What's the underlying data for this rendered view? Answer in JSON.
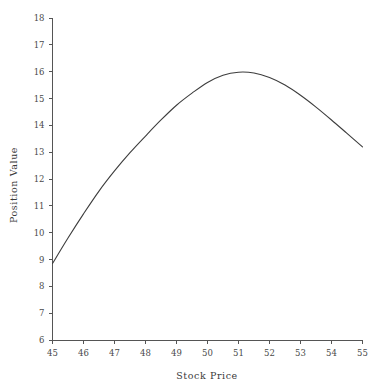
{
  "chart_data": {
    "type": "line",
    "title": "",
    "subtitle": "",
    "xlabel": "Stock Price",
    "ylabel": "Position Value",
    "xlim": [
      45,
      55
    ],
    "ylim": [
      6,
      18
    ],
    "grid": false,
    "legend": false,
    "legend_position": "none",
    "x_ticks": [
      45,
      46,
      47,
      48,
      49,
      50,
      51,
      52,
      53,
      54,
      55
    ],
    "x_tick_labels": [
      "45",
      "46",
      "47",
      "48",
      "49",
      "50",
      "51",
      "52",
      "53",
      "54",
      "55"
    ],
    "y_ticks": [
      6,
      7,
      8,
      9,
      10,
      11,
      12,
      13,
      14,
      15,
      16,
      17,
      18
    ],
    "y_tick_labels": [
      "6",
      "7",
      "8",
      "9",
      "10",
      "11",
      "12",
      "13",
      "14",
      "15",
      "16",
      "17",
      "18"
    ],
    "series": [
      {
        "name": "Position Value",
        "color": "#3d3d3d",
        "x": [
          45,
          45.5,
          46,
          46.5,
          47,
          47.5,
          48,
          48.5,
          49,
          49.5,
          50,
          50.5,
          51,
          51.5,
          52,
          52.5,
          53,
          53.5,
          54,
          54.5,
          55
        ],
        "values": [
          8.85,
          9.8,
          10.7,
          11.55,
          12.3,
          12.98,
          13.6,
          14.2,
          14.75,
          15.2,
          15.6,
          15.87,
          15.98,
          15.95,
          15.78,
          15.5,
          15.12,
          14.68,
          14.2,
          13.7,
          13.2
        ]
      }
    ]
  }
}
